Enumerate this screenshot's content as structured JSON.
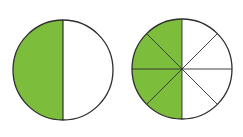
{
  "diagram": {
    "fill_color": "#7cbd3c",
    "stroke_color": "#2e2e2e",
    "background": "#ffffff",
    "circles": [
      {
        "name": "halves",
        "cx": 63,
        "cy": 70,
        "r": 50,
        "parts": 2,
        "shaded_parts": 1,
        "fraction": "1/2"
      },
      {
        "name": "eighths",
        "cx": 182,
        "cy": 69,
        "r": 50,
        "parts": 8,
        "shaded_parts": 4,
        "fraction": "4/8"
      }
    ]
  }
}
